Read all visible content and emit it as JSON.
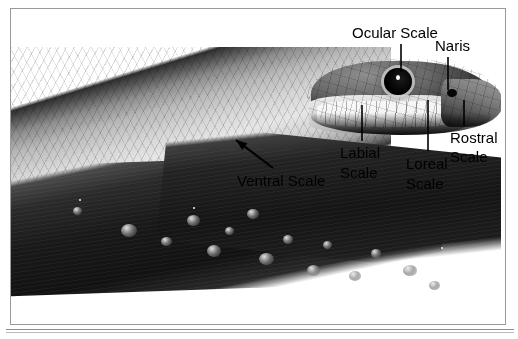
{
  "figure": {
    "kind": "labeled-photograph",
    "frame_color": "#9a9a9a",
    "label_color": "#000000",
    "background_color": "#ffffff"
  },
  "labels": [
    {
      "id": "ocular-scale",
      "text": "Ocular Scale",
      "lines": [
        "Ocular Scale"
      ],
      "x": 352,
      "y": 25,
      "leader": {
        "type": "line",
        "x1": 401,
        "y1": 44,
        "x2": 401,
        "y2": 72
      }
    },
    {
      "id": "naris",
      "text": "Naris",
      "lines": [
        "Naris"
      ],
      "x": 435,
      "y": 38,
      "leader": {
        "type": "line",
        "x1": 448,
        "y1": 57,
        "x2": 448,
        "y2": 90
      }
    },
    {
      "id": "labial-scale",
      "text": "Labial Scale",
      "lines": [
        "Labial",
        "Scale"
      ],
      "x": 340,
      "y": 145,
      "leader": {
        "type": "line",
        "x1": 362,
        "y1": 105,
        "x2": 362,
        "y2": 141
      }
    },
    {
      "id": "loreal-scale",
      "text": "Loreal Scale",
      "lines": [
        "Loreal",
        "Scale"
      ],
      "x": 406,
      "y": 156,
      "leader": {
        "type": "line",
        "x1": 428,
        "y1": 100,
        "x2": 428,
        "y2": 151
      }
    },
    {
      "id": "rostral-scale",
      "text": "Rostral Scale",
      "lines": [
        "Rostral",
        "Scale"
      ],
      "x": 450,
      "y": 130,
      "leader": {
        "type": "line",
        "x1": 464,
        "y1": 100,
        "x2": 464,
        "y2": 126
      }
    },
    {
      "id": "ventral-scale",
      "text": "Ventral Scale",
      "lines": [
        "Ventral Scale"
      ],
      "x": 237,
      "y": 173,
      "leader": {
        "type": "arrow",
        "x1": 273,
        "y1": 168,
        "x2": 236,
        "y2": 140
      }
    }
  ],
  "photo": {
    "description": "Black and white photograph of a snake resting on a wet dark branch, head facing right",
    "elements": [
      {
        "name": "snake-body",
        "note": "pale scaled body running from lower left to head at right"
      },
      {
        "name": "snake-head",
        "note": "head in right portion of frame with large dark eye"
      },
      {
        "name": "snake-eye",
        "note": "large round black eye"
      },
      {
        "name": "snake-nostril",
        "note": "small dark naris opening near snout tip"
      },
      {
        "name": "branch",
        "note": "dark wet branch beneath the snake covered with water droplets"
      }
    ]
  }
}
